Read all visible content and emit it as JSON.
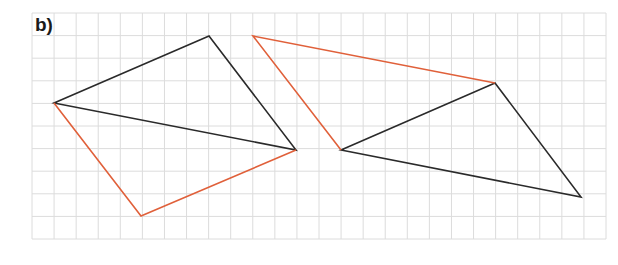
{
  "label": "b)",
  "colors": {
    "grid": "#dcdcdc",
    "black": "#2a2a2a",
    "red": "#e0603a"
  },
  "grid": {
    "x0": 32,
    "y0": 13,
    "x1": 606,
    "y1": 239,
    "cols": 26,
    "rows": 10
  },
  "shapes": [
    {
      "name": "left-black-triangle",
      "color": "black",
      "points": [
        [
          54,
          103
        ],
        [
          209,
          36
        ],
        [
          296,
          150
        ]
      ]
    },
    {
      "name": "left-red-path",
      "color": "red",
      "points": [
        [
          54,
          103
        ],
        [
          141,
          216
        ],
        [
          296,
          150
        ]
      ],
      "closed": false
    },
    {
      "name": "right-black-triangle",
      "color": "black",
      "points": [
        [
          341,
          150
        ],
        [
          495,
          83
        ],
        [
          581,
          197
        ]
      ]
    },
    {
      "name": "right-red-path",
      "color": "red",
      "points": [
        [
          341,
          150
        ],
        [
          253,
          36
        ],
        [
          495,
          83
        ]
      ],
      "closed": false
    }
  ]
}
